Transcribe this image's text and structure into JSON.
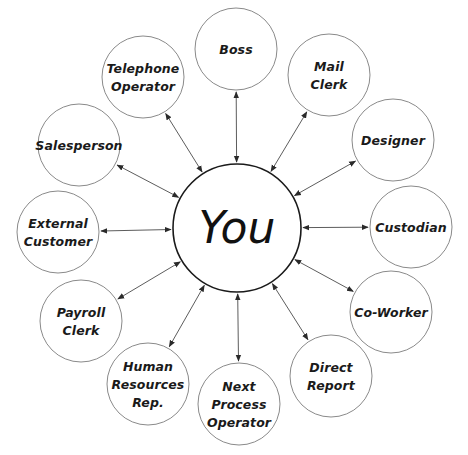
{
  "diagram": {
    "type": "hub-and-spoke relationship diagram",
    "center": {
      "id": "you",
      "label": "You",
      "x": 237,
      "y": 228,
      "r": 64
    },
    "nodes": [
      {
        "id": "boss",
        "lines": [
          "Boss"
        ],
        "x": 236,
        "y": 49,
        "r": 41
      },
      {
        "id": "mail-clerk",
        "lines": [
          "Mail",
          "Clerk"
        ],
        "x": 329,
        "y": 75,
        "r": 41
      },
      {
        "id": "designer",
        "lines": [
          "Designer"
        ],
        "x": 393,
        "y": 140,
        "r": 41
      },
      {
        "id": "custodian",
        "lines": [
          "Custodian"
        ],
        "x": 411,
        "y": 227,
        "r": 41
      },
      {
        "id": "co-worker",
        "lines": [
          "Co-Worker"
        ],
        "x": 391,
        "y": 312,
        "r": 41
      },
      {
        "id": "direct-report",
        "lines": [
          "Direct",
          "Report"
        ],
        "x": 331,
        "y": 376,
        "r": 41
      },
      {
        "id": "next-process-operator",
        "lines": [
          "Next",
          "Process",
          "Operator"
        ],
        "x": 239,
        "y": 404,
        "r": 41
      },
      {
        "id": "human-resources-rep",
        "lines": [
          "Human",
          "Resources",
          "Rep."
        ],
        "x": 148,
        "y": 384,
        "r": 41
      },
      {
        "id": "payroll-clerk",
        "lines": [
          "Payroll",
          "Clerk"
        ],
        "x": 81,
        "y": 321,
        "r": 41
      },
      {
        "id": "external-customer",
        "lines": [
          "External",
          "Customer"
        ],
        "x": 58,
        "y": 232,
        "r": 41
      },
      {
        "id": "salesperson",
        "lines": [
          "Salesperson"
        ],
        "x": 79,
        "y": 145,
        "r": 41
      },
      {
        "id": "telephone-operator",
        "lines": [
          "Telephone",
          "Operator"
        ],
        "x": 143,
        "y": 77,
        "r": 41
      }
    ],
    "edges": [
      {
        "from": "you",
        "to": "boss",
        "direction": "bidirectional"
      },
      {
        "from": "you",
        "to": "mail-clerk",
        "direction": "bidirectional"
      },
      {
        "from": "you",
        "to": "designer",
        "direction": "bidirectional"
      },
      {
        "from": "you",
        "to": "custodian",
        "direction": "bidirectional"
      },
      {
        "from": "you",
        "to": "co-worker",
        "direction": "bidirectional"
      },
      {
        "from": "you",
        "to": "direct-report",
        "direction": "bidirectional"
      },
      {
        "from": "you",
        "to": "next-process-operator",
        "direction": "bidirectional"
      },
      {
        "from": "you",
        "to": "human-resources-rep",
        "direction": "bidirectional"
      },
      {
        "from": "you",
        "to": "payroll-clerk",
        "direction": "bidirectional"
      },
      {
        "from": "you",
        "to": "external-customer",
        "direction": "bidirectional"
      },
      {
        "from": "you",
        "to": "salesperson",
        "direction": "bidirectional"
      },
      {
        "from": "you",
        "to": "telephone-operator",
        "direction": "bidirectional"
      }
    ],
    "colors": {
      "background": "#ffffff",
      "node_stroke": "#8a8a8a",
      "center_stroke": "#1a1a1a",
      "arrow": "#4a4a4a",
      "text": "#1a1a1a"
    }
  }
}
